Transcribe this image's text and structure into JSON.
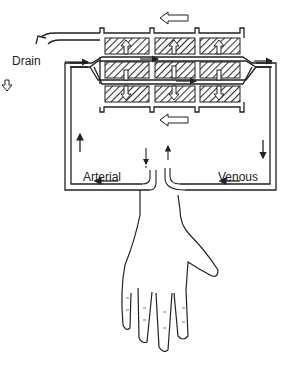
{
  "diagram": {
    "labels": {
      "drain": "Drain",
      "arterial": "Arterial",
      "venous": "Venous"
    },
    "components": [
      "dialyzer-cartridge",
      "dialysate-channels",
      "blood-channels",
      "arterial-line",
      "venous-line",
      "hand-with-fistula",
      "drain-outlet"
    ],
    "colors": {
      "line": "#222222",
      "hatch": "#444444",
      "background": "#ffffff"
    }
  }
}
